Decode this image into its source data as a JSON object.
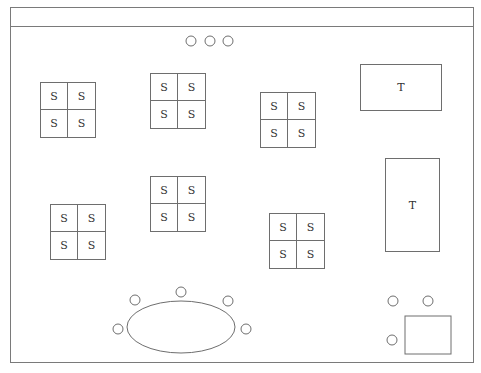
{
  "diagram": {
    "type": "floor-plan",
    "stroke_color": "#6e6e6e",
    "seat_label": "S",
    "table_label": "T",
    "top_circles": [
      {
        "cx": 191,
        "cy": 41,
        "r": 5
      },
      {
        "cx": 210,
        "cy": 41,
        "r": 5
      },
      {
        "cx": 228,
        "cy": 41,
        "r": 5
      }
    ],
    "seat_blocks": [
      {
        "x": 40,
        "y": 82,
        "cells": [
          "S",
          "S",
          "S",
          "S"
        ]
      },
      {
        "x": 150,
        "y": 73,
        "cells": [
          "S",
          "S",
          "S",
          "S"
        ]
      },
      {
        "x": 260,
        "y": 92,
        "cells": [
          "S",
          "S",
          "S",
          "S"
        ]
      },
      {
        "x": 50,
        "y": 204,
        "cells": [
          "S",
          "S",
          "S",
          "S"
        ]
      },
      {
        "x": 150,
        "y": 176,
        "cells": [
          "S",
          "S",
          "S",
          "S"
        ]
      },
      {
        "x": 269,
        "y": 213,
        "cells": [
          "S",
          "S",
          "S",
          "S"
        ]
      }
    ],
    "tables": [
      {
        "x": 360,
        "y": 64,
        "w": 82,
        "h": 47,
        "label": "T"
      },
      {
        "x": 385,
        "y": 158,
        "w": 55,
        "h": 94,
        "label": "T"
      }
    ],
    "oval_table": {
      "cx": 181,
      "cy": 327,
      "rx": 54,
      "ry": 26
    },
    "oval_chairs": [
      {
        "cx": 118,
        "cy": 329,
        "r": 5
      },
      {
        "cx": 135,
        "cy": 300,
        "r": 5
      },
      {
        "cx": 181,
        "cy": 292,
        "r": 5
      },
      {
        "cx": 228,
        "cy": 301,
        "r": 5
      },
      {
        "cx": 246,
        "cy": 329,
        "r": 5
      }
    ],
    "corner_circles": [
      {
        "cx": 393,
        "cy": 301,
        "r": 5
      },
      {
        "cx": 428,
        "cy": 301,
        "r": 5
      },
      {
        "cx": 392,
        "cy": 340,
        "r": 5
      }
    ],
    "corner_box": {
      "x": 405,
      "y": 316,
      "w": 46,
      "h": 38
    }
  }
}
